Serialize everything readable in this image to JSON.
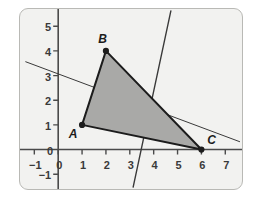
{
  "figure": {
    "title": "",
    "panel": {
      "background_color": "#f2f2f0",
      "border_color": "#b9b9b5"
    }
  },
  "chart_data": {
    "type": "scatter",
    "title": "",
    "xlabel": "",
    "ylabel": "",
    "xlim": [
      -1.6,
      7.7
    ],
    "ylim": [
      -1.6,
      5.7
    ],
    "grid": false,
    "legend": null,
    "x_ticks": [
      -1,
      0,
      1,
      2,
      3,
      4,
      5,
      6,
      7
    ],
    "x_tick_labels": [
      "−1",
      "0",
      "1",
      "2",
      "3",
      "4",
      "5",
      "6",
      "7"
    ],
    "y_ticks": [
      -1,
      0,
      1,
      2,
      3,
      4,
      5
    ],
    "y_tick_labels": [
      "−1",
      "0",
      "1",
      "2",
      "3",
      "4",
      "5"
    ],
    "points": [
      {
        "name": "A",
        "label": "A",
        "x": 1,
        "y": 1,
        "label_dx": -0.42,
        "label_dy": -0.32
      },
      {
        "name": "B",
        "label": "B",
        "x": 2,
        "y": 4,
        "label_dx": -0.18,
        "label_dy": 0.52
      },
      {
        "name": "C",
        "label": "C",
        "x": 6,
        "y": 0,
        "label_dx": 0.38,
        "label_dy": 0.42
      }
    ],
    "polygons": [
      {
        "name": "triangle-ABC",
        "vertices": [
          [
            1,
            1
          ],
          [
            2,
            4
          ],
          [
            6,
            0
          ]
        ],
        "fill": "#a9a9a7",
        "fill_opacity": 1,
        "stroke": "#1c1c1c",
        "stroke_width": 2
      }
    ],
    "lines": [
      {
        "name": "shallow-line",
        "from": [
          -1.36,
          3.56
        ],
        "to": [
          7.6,
          0.32
        ],
        "stroke": "#3a3a3a",
        "stroke_width": 1
      },
      {
        "name": "steep-line",
        "from": [
          4.72,
          5.62
        ],
        "to": [
          3.14,
          -1.52
        ],
        "stroke": "#3a3a3a",
        "stroke_width": 1.4
      }
    ],
    "axis_color": "#4a4a4a"
  }
}
